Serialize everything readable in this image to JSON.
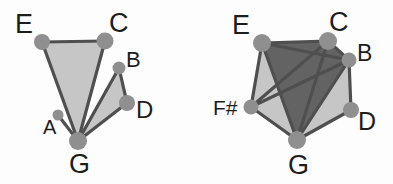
{
  "image": {
    "title": "Two pitch-class set graphs",
    "background_color": "#fdfdfd",
    "width": 393,
    "height": 184
  },
  "palette": {
    "node_fill": "#8f8f8f",
    "edge_stroke": "#4f4f4f",
    "face_light": "#c6c6c6",
    "face_dark": "#636363",
    "label_color": "#1d1d1d"
  },
  "figures": [
    {
      "id": "left-figure",
      "name": "left-graph",
      "nodes": [
        {
          "id": "E",
          "label": "E",
          "cx": 42,
          "cy": 42,
          "r": 8,
          "label_x": 15,
          "label_y": 33,
          "font_size": 27
        },
        {
          "id": "C",
          "label": "C",
          "cx": 105,
          "cy": 41,
          "r": 8.5,
          "label_x": 109,
          "label_y": 32,
          "font_size": 27
        },
        {
          "id": "B",
          "label": "B",
          "cx": 119,
          "cy": 68,
          "r": 6.5,
          "label_x": 126,
          "label_y": 67,
          "font_size": 22
        },
        {
          "id": "D",
          "label": "D",
          "cx": 127,
          "cy": 103,
          "r": 8,
          "label_x": 136,
          "label_y": 118,
          "font_size": 24
        },
        {
          "id": "A",
          "label": "A",
          "cx": 58,
          "cy": 115,
          "r": 5.5,
          "label_x": 43,
          "label_y": 134,
          "font_size": 20
        },
        {
          "id": "G",
          "label": "G",
          "cx": 78,
          "cy": 141,
          "r": 9,
          "label_x": 69,
          "label_y": 173,
          "font_size": 27
        }
      ],
      "faces": [
        {
          "name": "face-ECG",
          "points": "42,42 105,41 78,141",
          "shade": "light"
        },
        {
          "name": "face-BDG",
          "points": "119,68 127,103 78,141",
          "shade": "light"
        }
      ],
      "edges": [
        {
          "from": "E",
          "to": "C"
        },
        {
          "from": "E",
          "to": "G"
        },
        {
          "from": "C",
          "to": "G"
        },
        {
          "from": "B",
          "to": "D"
        },
        {
          "from": "B",
          "to": "G"
        },
        {
          "from": "D",
          "to": "G"
        },
        {
          "from": "A",
          "to": "G"
        }
      ]
    },
    {
      "id": "right-figure",
      "name": "right-graph",
      "nodes": [
        {
          "id": "E",
          "label": "E",
          "cx": 262,
          "cy": 43,
          "r": 9,
          "label_x": 232,
          "label_y": 34,
          "font_size": 27
        },
        {
          "id": "C",
          "label": "C",
          "cx": 328,
          "cy": 41,
          "r": 9,
          "label_x": 329,
          "label_y": 31,
          "font_size": 27
        },
        {
          "id": "B",
          "label": "B",
          "cx": 349,
          "cy": 60,
          "r": 7.5,
          "label_x": 357,
          "label_y": 61,
          "font_size": 23
        },
        {
          "id": "D",
          "label": "D",
          "cx": 351,
          "cy": 110,
          "r": 8,
          "label_x": 358,
          "label_y": 130,
          "font_size": 25
        },
        {
          "id": "G",
          "label": "G",
          "cx": 297,
          "cy": 140,
          "r": 9,
          "label_x": 288,
          "label_y": 174,
          "font_size": 27
        },
        {
          "id": "F#",
          "label": "F#",
          "cx": 251,
          "cy": 107,
          "r": 7.5,
          "label_x": 213,
          "label_y": 115,
          "font_size": 21
        }
      ],
      "faces": [
        {
          "name": "face-pentagon",
          "points": "262,43 328,41 349,60 351,110 297,140 251,107",
          "shade": "light"
        },
        {
          "name": "face-ECB",
          "points": "262,43 328,41 349,60",
          "shade": "dark"
        },
        {
          "name": "face-ECG",
          "points": "262,43 328,41 297,140",
          "shade": "dark"
        },
        {
          "name": "face-EBG",
          "points": "262,43 349,60 297,140",
          "shade": "dark"
        },
        {
          "name": "face-CBG",
          "points": "328,41 349,60 297,140",
          "shade": "dark"
        }
      ],
      "edges": [
        {
          "from": "E",
          "to": "C"
        },
        {
          "from": "C",
          "to": "B"
        },
        {
          "from": "B",
          "to": "D"
        },
        {
          "from": "D",
          "to": "G"
        },
        {
          "from": "G",
          "to": "F#"
        },
        {
          "from": "F#",
          "to": "E"
        },
        {
          "from": "E",
          "to": "B"
        },
        {
          "from": "E",
          "to": "G"
        },
        {
          "from": "C",
          "to": "G"
        },
        {
          "from": "C",
          "to": "F#"
        },
        {
          "from": "B",
          "to": "G"
        },
        {
          "from": "B",
          "to": "F#"
        }
      ]
    }
  ]
}
